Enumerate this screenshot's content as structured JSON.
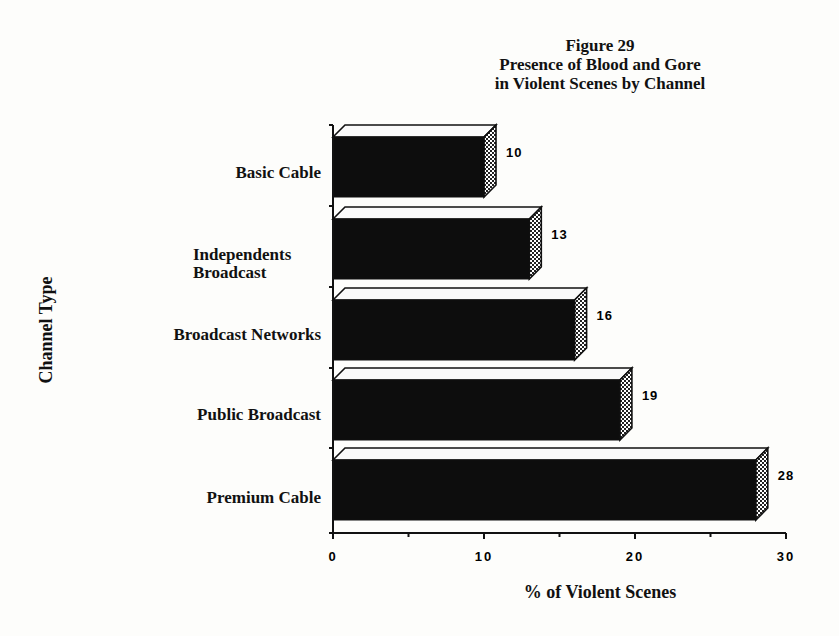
{
  "chart_data": {
    "type": "bar",
    "orientation": "horizontal",
    "style": "3d",
    "title": "Figure 29",
    "subtitle": "Presence of Blood and Gore in Violent Scenes by Channel",
    "title_lines": [
      "Figure 29",
      "Presence of Blood and Gore",
      "in Violent Scenes by Channel"
    ],
    "xlabel": "% of Violent Scenes",
    "ylabel": "Channel Type",
    "categories": [
      "Basic Cable",
      "Independents Broadcast",
      "Broadcast Networks",
      "Public Broadcast",
      "Premium Cable"
    ],
    "values": [
      10,
      13,
      16,
      19,
      28
    ],
    "data_labels": [
      "10",
      "13",
      "16",
      "19",
      "28"
    ],
    "xlim": [
      0,
      30
    ],
    "x_ticks": [
      "0",
      "10",
      "20",
      "30"
    ],
    "grid": false,
    "legend": null,
    "colors": {
      "bar_front": "#0d0d0d",
      "bar_top": "#fafafa",
      "bar_side": "checker"
    }
  }
}
